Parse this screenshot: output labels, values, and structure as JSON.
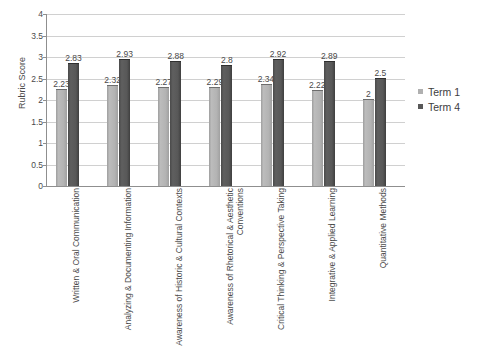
{
  "chart_data": {
    "type": "bar",
    "title": "",
    "xlabel": "",
    "ylabel": "Rubric Score",
    "ylim": [
      0,
      4
    ],
    "yticks": [
      "0",
      "0.5",
      "1",
      "1.5",
      "2",
      "2.5",
      "3",
      "3.5",
      "4"
    ],
    "grid": true,
    "legend_position": "right",
    "categories": [
      "Written & Oral Communication",
      "Analyzing & Documenting Information",
      "Awareness of Historic & Cultural Contexts",
      "Awareness of Rhetorical & Aesthetic Conventions",
      "Critical Thinking & Perspective Taking",
      "Integrative & Applied Learning",
      "Quantitative Methods"
    ],
    "series": [
      {
        "name": "Term 1",
        "color": "#b3b3b3",
        "values": [
          2.23,
          2.32,
          2.27,
          2.29,
          2.34,
          2.22,
          2
        ],
        "labels": [
          "2.23",
          "2.32",
          "2.27",
          "2.29",
          "2.34",
          "2.22",
          "2"
        ]
      },
      {
        "name": "Term 4",
        "color": "#585858",
        "values": [
          2.83,
          2.93,
          2.88,
          2.8,
          2.92,
          2.89,
          2.5
        ],
        "labels": [
          "2.83",
          "2.93",
          "2.88",
          "2.8",
          "2.92",
          "2.89",
          "2.5"
        ]
      }
    ]
  },
  "axis": {
    "y_title": "Rubric Score"
  },
  "legend": {
    "items": [
      {
        "label": "Term 1"
      },
      {
        "label": "Term 4"
      }
    ]
  },
  "title_remnant": {
    "text": ""
  }
}
